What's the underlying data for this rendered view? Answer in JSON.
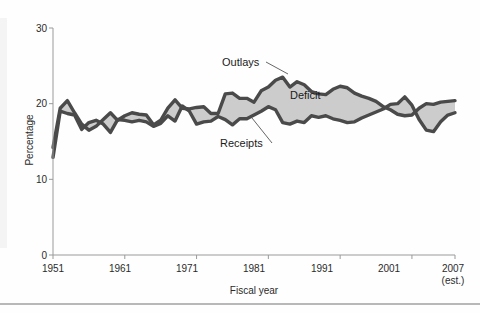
{
  "figure": {
    "title": "",
    "axis_x_title": "Fiscal year",
    "axis_y_title": "Percentage"
  },
  "labels": {
    "outlays": "Outlays",
    "receipts": "Receipts",
    "deficit": "Deficit",
    "estimate_note": "(est.)",
    "end_year": "2007"
  },
  "colors": {
    "line": "#4a4a4a",
    "band_fill": "#cccccc",
    "axis": "#9a9a9a",
    "text": "#1b1b1b"
  },
  "chart_data": {
    "type": "line",
    "title": "",
    "subtitle": "",
    "xlabel": "Fiscal year",
    "ylabel": "Percentage",
    "xlim": [
      1951,
      2007
    ],
    "ylim": [
      0,
      30
    ],
    "yticks": [
      0,
      10,
      20,
      30
    ],
    "ytick_labels": [
      "0",
      "10",
      "20",
      "30"
    ],
    "xticks": [
      1951,
      1961,
      1971,
      1981,
      1991,
      2001,
      2007
    ],
    "xtick_labels": [
      "1951",
      "1961",
      "1971",
      "1981",
      "1991",
      "2001",
      "2007"
    ],
    "grid": false,
    "legend": "inline-annotations",
    "annotations": [
      {
        "text": "Outlays",
        "x": 1974.0,
        "y": 25.6
      },
      {
        "text": "Receipts",
        "x": 1974.5,
        "y": 14.4
      },
      {
        "text": "Deficit",
        "x": 1985.0,
        "y": 20.0
      }
    ],
    "band": {
      "name": "Deficit",
      "between": [
        "Receipts",
        "Outlays"
      ],
      "fill": "#cccccc"
    },
    "x": [
      1951,
      1952,
      1953,
      1954,
      1955,
      1956,
      1957,
      1958,
      1959,
      1960,
      1961,
      1962,
      1963,
      1964,
      1965,
      1966,
      1967,
      1968,
      1969,
      1970,
      1971,
      1972,
      1973,
      1974,
      1975,
      1976,
      1977,
      1978,
      1979,
      1980,
      1981,
      1982,
      1983,
      1984,
      1985,
      1986,
      1987,
      1988,
      1989,
      1990,
      1991,
      1992,
      1993,
      1994,
      1995,
      1996,
      1997,
      1998,
      1999,
      2000,
      2001,
      2002,
      2003,
      2004,
      2005,
      2006,
      2007
    ],
    "series": [
      {
        "name": "Outlays",
        "values": [
          14.2,
          19.4,
          20.4,
          18.8,
          17.3,
          16.5,
          17.0,
          17.9,
          18.8,
          17.8,
          18.4,
          18.8,
          18.6,
          18.5,
          17.2,
          17.8,
          19.4,
          20.5,
          19.4,
          19.3,
          19.5,
          19.6,
          18.7,
          18.7,
          21.3,
          21.4,
          20.7,
          20.7,
          20.2,
          21.7,
          22.2,
          23.1,
          23.5,
          22.2,
          22.9,
          22.5,
          21.6,
          21.3,
          21.2,
          21.9,
          22.3,
          22.1,
          21.4,
          21.0,
          20.7,
          20.3,
          19.6,
          19.2,
          18.6,
          18.4,
          18.5,
          19.4,
          20.0,
          19.9,
          20.2,
          20.3,
          20.4
        ]
      },
      {
        "name": "Receipts",
        "values": [
          12.9,
          19.0,
          18.7,
          18.5,
          16.6,
          17.5,
          17.8,
          17.3,
          16.2,
          17.9,
          17.8,
          17.6,
          17.8,
          17.6,
          17.0,
          17.4,
          18.4,
          17.7,
          19.7,
          19.0,
          17.3,
          17.6,
          17.7,
          18.3,
          17.9,
          17.2,
          18.0,
          18.0,
          18.5,
          19.0,
          19.6,
          19.2,
          17.5,
          17.3,
          17.7,
          17.5,
          18.4,
          18.2,
          18.4,
          18.0,
          17.8,
          17.5,
          17.6,
          18.1,
          18.5,
          18.9,
          19.3,
          19.9,
          20.0,
          20.9,
          19.8,
          17.9,
          16.5,
          16.3,
          17.6,
          18.5,
          18.8
        ]
      }
    ]
  }
}
